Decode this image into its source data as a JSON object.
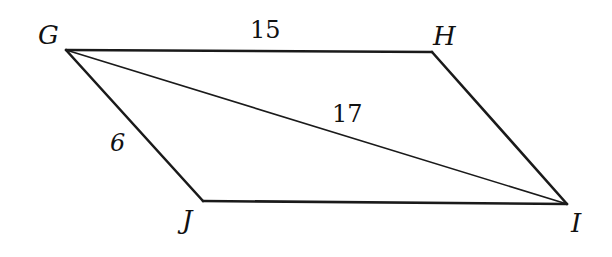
{
  "figure": {
    "type": "parallelogram",
    "vertices": {
      "G": {
        "label": "G",
        "x": 66,
        "y": 50
      },
      "H": {
        "label": "H",
        "x": 432,
        "y": 52
      },
      "I": {
        "label": "I",
        "x": 567,
        "y": 204
      },
      "J": {
        "label": "J",
        "x": 203,
        "y": 201
      }
    },
    "edges": [
      {
        "from": "G",
        "to": "H",
        "length_label": "15"
      },
      {
        "from": "H",
        "to": "I",
        "length_label": ""
      },
      {
        "from": "I",
        "to": "J",
        "length_label": ""
      },
      {
        "from": "J",
        "to": "G",
        "length_label": "6"
      }
    ],
    "diagonal": {
      "from": "G",
      "to": "I",
      "length_label": "17"
    },
    "colors": {
      "stroke": "#1a1a1a",
      "background": "#ffffff"
    }
  }
}
